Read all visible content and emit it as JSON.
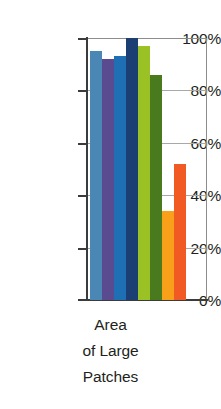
{
  "chart_data": {
    "type": "bar",
    "title": "",
    "subtitle": "",
    "xlabel": "Area of Large Patches",
    "xlabel_lines": [
      "Area",
      "of Large",
      "Patches"
    ],
    "ylabel": "",
    "categories": [
      "Area of Large Patches"
    ],
    "ylim": [
      0,
      100
    ],
    "y_unit": "%",
    "grid": true,
    "grid_axis": "y",
    "legend": "none",
    "y_ticks": [
      {
        "value": 100,
        "label": "100%"
      },
      {
        "value": 80,
        "label": "80%"
      },
      {
        "value": 60,
        "label": "60%"
      },
      {
        "value": 40,
        "label": "40%"
      },
      {
        "value": 20,
        "label": "20%"
      },
      {
        "value": 0,
        "label": "0%"
      }
    ],
    "series": [
      {
        "name": "Series 1",
        "values": [
          95
        ],
        "color": "#4a87b5"
      },
      {
        "name": "Series 2",
        "values": [
          92
        ],
        "color": "#5a4a8f"
      },
      {
        "name": "Series 3",
        "values": [
          93
        ],
        "color": "#1f6fb4"
      },
      {
        "name": "Series 4",
        "values": [
          100
        ],
        "color": "#1b3f72"
      },
      {
        "name": "Series 5",
        "values": [
          97
        ],
        "color": "#9bc225"
      },
      {
        "name": "Series 6",
        "values": [
          86
        ],
        "color": "#4a7a1e"
      },
      {
        "name": "Series 7",
        "values": [
          34
        ],
        "color": "#f9a01b"
      },
      {
        "name": "Series 8",
        "values": [
          52
        ],
        "color": "#f15a22"
      }
    ],
    "bars": [
      {
        "name": "bar-1",
        "value": 95,
        "label": "95%",
        "color": "#4a87b5"
      },
      {
        "name": "bar-2",
        "value": 92,
        "label": "92%",
        "color": "#5a4a8f"
      },
      {
        "name": "bar-3",
        "value": 93,
        "label": "93%",
        "color": "#1f6fb4"
      },
      {
        "name": "bar-4",
        "value": 100,
        "label": "100%",
        "color": "#1b3f72"
      },
      {
        "name": "bar-5",
        "value": 97,
        "label": "97%",
        "color": "#9bc225"
      },
      {
        "name": "bar-6",
        "value": 86,
        "label": "86%",
        "color": "#4a7a1e"
      },
      {
        "name": "bar-7",
        "value": 34,
        "label": "34%",
        "color": "#f9a01b"
      },
      {
        "name": "bar-8",
        "value": 52,
        "label": "52%",
        "color": "#f15a22"
      }
    ]
  }
}
